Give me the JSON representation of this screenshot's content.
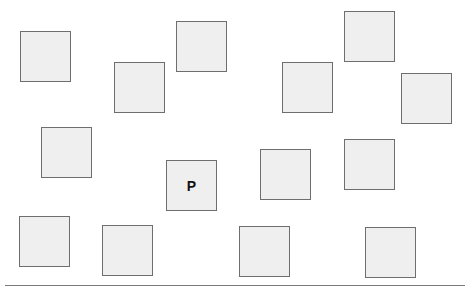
{
  "board": {
    "tiles": [
      {
        "x": 20,
        "y": 31,
        "label": ""
      },
      {
        "x": 114,
        "y": 62,
        "label": ""
      },
      {
        "x": 176,
        "y": 21,
        "label": ""
      },
      {
        "x": 282,
        "y": 62,
        "label": ""
      },
      {
        "x": 344,
        "y": 11,
        "label": ""
      },
      {
        "x": 401,
        "y": 73,
        "label": ""
      },
      {
        "x": 41,
        "y": 127,
        "label": ""
      },
      {
        "x": 166,
        "y": 160,
        "label": "P"
      },
      {
        "x": 260,
        "y": 149,
        "label": ""
      },
      {
        "x": 344,
        "y": 139,
        "label": ""
      },
      {
        "x": 19,
        "y": 216,
        "label": ""
      },
      {
        "x": 102,
        "y": 225,
        "label": ""
      },
      {
        "x": 239,
        "y": 226,
        "label": ""
      },
      {
        "x": 365,
        "y": 227,
        "label": ""
      }
    ]
  },
  "colors": {
    "tile_fill": "#efefef",
    "tile_border": "#6e6e6e",
    "baseline": "#7a7a7a"
  }
}
